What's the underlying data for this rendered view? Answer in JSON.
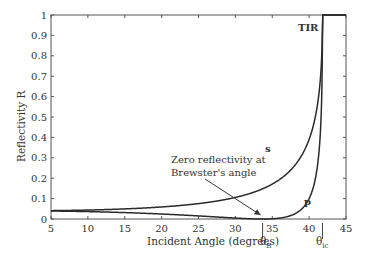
{
  "chart_data": {
    "type": "line",
    "title": "",
    "xlabel": "Incident Angle (degrees)",
    "ylabel": "Reflectivity R",
    "xlim": [
      5,
      45
    ],
    "ylim": [
      0,
      1
    ],
    "x_ticks": [
      5,
      10,
      15,
      20,
      25,
      30,
      35,
      40,
      45
    ],
    "y_ticks": [
      0,
      0.1,
      0.2,
      0.3,
      0.4,
      0.5,
      0.6,
      0.7,
      0.8,
      0.9,
      1
    ],
    "y_tick_labels": [
      "0",
      "0.1",
      "0.2",
      "0.3",
      "0.4",
      "0.5",
      "0.6",
      "0.7",
      "0.8",
      "0.9",
      "1"
    ],
    "grid": false,
    "legend": null,
    "n1": 1.5,
    "n2": 1.0,
    "series": [
      {
        "name": "s",
        "x": [
          5,
          10,
          15,
          20,
          25,
          30,
          33.7,
          35,
          38,
          40,
          41,
          41.5,
          41.8,
          45
        ],
        "values": [
          0.041,
          0.043,
          0.047,
          0.055,
          0.071,
          0.101,
          0.148,
          0.172,
          0.27,
          0.41,
          0.53,
          0.65,
          1.0,
          1.0
        ]
      },
      {
        "name": "p",
        "x": [
          5,
          10,
          15,
          20,
          25,
          30,
          33.7,
          35,
          38,
          40,
          41,
          41.5,
          41.8,
          45
        ],
        "values": [
          0.039,
          0.036,
          0.031,
          0.023,
          0.012,
          0.003,
          0.0,
          0.002,
          0.04,
          0.16,
          0.33,
          0.52,
          1.0,
          1.0
        ]
      }
    ],
    "annotations": [
      {
        "text": "TIR",
        "x": 40.5,
        "y": 0.96
      },
      {
        "text": "s",
        "x": 36.3,
        "y": 0.36
      },
      {
        "text": "p",
        "x": 38.7,
        "y": 0.11
      },
      {
        "text": "Zero reflectivity at Brewster's angle",
        "arrow_to": [
          33.7,
          0.0
        ]
      },
      {
        "text": "θB",
        "x": 33.7,
        "below_axis": true
      },
      {
        "text": "θic",
        "x": 41.8,
        "below_axis": true
      }
    ]
  },
  "labels": {
    "xlabel": "Incident Angle (degrees)",
    "ylabel": "Reflectivity R",
    "tir": "TIR",
    "s": "s",
    "p": "p",
    "annotation_line1": "Zero reflectivity at",
    "annotation_line2": "Brewster's angle",
    "theta": "θ",
    "brewster_sub": "B",
    "critical_sub": "ic"
  }
}
